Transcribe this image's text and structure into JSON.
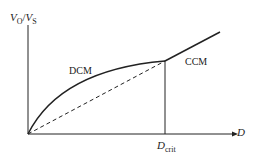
{
  "diagram": {
    "y_axis": {
      "label_var": "V",
      "label_sub1": "O",
      "label_sep": "/",
      "label_var2": "V",
      "label_sub2": "S"
    },
    "x_axis": {
      "label": "D"
    },
    "marker": {
      "label_var": "D",
      "label_sub": "crit"
    },
    "regions": {
      "left": "DCM",
      "right": "CCM"
    },
    "curves": [
      {
        "name": "DCM curve",
        "style": "solid",
        "from": [
          0,
          0
        ],
        "to": "D_crit"
      },
      {
        "name": "CCM line",
        "style": "solid",
        "from": "D_crit",
        "to": "beyond"
      },
      {
        "name": "reference line",
        "style": "dashed",
        "from": [
          0,
          0
        ],
        "to": "D_crit"
      }
    ],
    "colors": {
      "line": "#222222",
      "background": "#ffffff"
    }
  }
}
